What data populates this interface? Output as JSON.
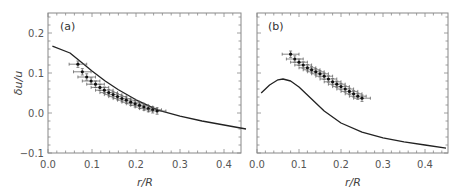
{
  "chart_data": [
    {
      "type": "scatter",
      "panel": "(a)",
      "xlabel": "r/R",
      "ylabel": "δu/u",
      "xlim": [
        0.0,
        0.45
      ],
      "ylim": [
        -0.1,
        0.25
      ],
      "xticks": [
        "0.0",
        "0.1",
        "0.2",
        "0.3",
        "0.4"
      ],
      "yticks": [
        "-0.1",
        "0.0",
        "0.1",
        "0.2"
      ],
      "grid": false,
      "series": [
        {
          "name": "model curve",
          "kind": "line",
          "x": [
            0.01,
            0.05,
            0.08,
            0.1,
            0.13,
            0.16,
            0.2,
            0.25,
            0.3,
            0.35,
            0.4,
            0.45
          ],
          "y": [
            0.167,
            0.15,
            0.123,
            0.105,
            0.08,
            0.058,
            0.033,
            0.007,
            -0.008,
            -0.02,
            -0.03,
            -0.04
          ]
        },
        {
          "name": "data",
          "kind": "points-with-errorbars",
          "x": [
            0.068,
            0.078,
            0.088,
            0.098,
            0.108,
            0.118,
            0.128,
            0.138,
            0.148,
            0.158,
            0.168,
            0.178,
            0.188,
            0.198,
            0.208,
            0.218,
            0.228,
            0.238,
            0.248
          ],
          "y": [
            0.122,
            0.103,
            0.09,
            0.08,
            0.072,
            0.064,
            0.057,
            0.051,
            0.046,
            0.041,
            0.036,
            0.032,
            0.027,
            0.023,
            0.019,
            0.015,
            0.011,
            0.008,
            0.005
          ],
          "xerr": 0.02,
          "yerr": 0.008
        }
      ]
    },
    {
      "type": "scatter",
      "panel": "(b)",
      "xlabel": "r/R",
      "ylabel": "",
      "xlim": [
        0.0,
        0.45
      ],
      "ylim": [
        -0.1,
        0.25
      ],
      "xticks": [
        "0.0",
        "0.1",
        "0.2",
        "0.3",
        "0.4"
      ],
      "yticks": [],
      "grid": false,
      "series": [
        {
          "name": "model curve",
          "kind": "line",
          "x": [
            0.01,
            0.03,
            0.05,
            0.062,
            0.08,
            0.1,
            0.13,
            0.16,
            0.2,
            0.25,
            0.3,
            0.35,
            0.4,
            0.45
          ],
          "y": [
            0.05,
            0.07,
            0.083,
            0.085,
            0.08,
            0.065,
            0.035,
            0.005,
            -0.025,
            -0.048,
            -0.062,
            -0.072,
            -0.08,
            -0.088
          ]
        },
        {
          "name": "data",
          "kind": "points-with-errorbars",
          "x": [
            0.08,
            0.09,
            0.1,
            0.11,
            0.12,
            0.13,
            0.14,
            0.15,
            0.16,
            0.17,
            0.18,
            0.19,
            0.2,
            0.21,
            0.22,
            0.23,
            0.24,
            0.25
          ],
          "y": [
            0.147,
            0.135,
            0.127,
            0.12,
            0.113,
            0.108,
            0.103,
            0.098,
            0.092,
            0.085,
            0.078,
            0.072,
            0.066,
            0.06,
            0.054,
            0.048,
            0.042,
            0.037
          ],
          "xerr": 0.02,
          "yerr": 0.008
        }
      ]
    }
  ],
  "labels": {
    "panel_a": "(a)",
    "panel_b": "(b)",
    "xlabel": "r/R",
    "ylabel": "δu/u"
  }
}
